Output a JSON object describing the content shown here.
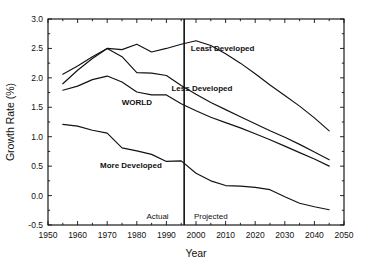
{
  "chart_data": {
    "type": "line",
    "title": "",
    "xlabel": "Year",
    "ylabel": "Growth Rate (%)",
    "xlim": [
      1950,
      2050
    ],
    "ylim": [
      -0.5,
      3.0
    ],
    "xticks": [
      1950,
      1960,
      1970,
      1980,
      1990,
      2000,
      2010,
      2020,
      2030,
      2040,
      2050
    ],
    "xtick_labels": [
      "1950",
      "1960",
      "1970",
      "1980",
      "1990",
      "2000",
      "2010",
      "2020",
      "2030",
      "2040",
      "2050"
    ],
    "yticks": [
      -0.5,
      0.0,
      0.5,
      1.0,
      1.5,
      2.0,
      2.5,
      3.0
    ],
    "ytick_labels": [
      "-0.5",
      "0.0",
      "0.5",
      "1.0",
      "1.5",
      "2.0",
      "2.5",
      "3.0"
    ],
    "grid": false,
    "legend_position": "inline-annotations",
    "x": [
      1955,
      1960,
      1965,
      1970,
      1975,
      1980,
      1985,
      1990,
      1995,
      2000,
      2005,
      2010,
      2015,
      2020,
      2025,
      2030,
      2035,
      2040,
      2045
    ],
    "series": [
      {
        "name": "Least Developed",
        "label": "Least Developed",
        "values": [
          2.06,
          2.2,
          2.36,
          2.5,
          2.48,
          2.57,
          2.44,
          2.5,
          2.57,
          2.63,
          2.55,
          2.41,
          2.25,
          2.07,
          1.88,
          1.7,
          1.52,
          1.32,
          1.1
        ]
      },
      {
        "name": "Less Developed",
        "label": "Less Developed",
        "values": [
          1.9,
          2.13,
          2.33,
          2.5,
          2.36,
          2.09,
          2.08,
          2.04,
          1.87,
          1.72,
          1.58,
          1.46,
          1.34,
          1.22,
          1.1,
          0.99,
          0.87,
          0.74,
          0.61
        ]
      },
      {
        "name": "WORLD",
        "label": "WORLD",
        "values": [
          1.79,
          1.86,
          1.97,
          2.03,
          1.93,
          1.76,
          1.71,
          1.71,
          1.56,
          1.44,
          1.33,
          1.24,
          1.15,
          1.05,
          0.95,
          0.84,
          0.73,
          0.62,
          0.5
        ]
      },
      {
        "name": "More Developed",
        "label": "More Developed",
        "values": [
          1.21,
          1.18,
          1.11,
          1.06,
          0.81,
          0.76,
          0.7,
          0.58,
          0.59,
          0.38,
          0.25,
          0.17,
          0.16,
          0.14,
          0.1,
          -0.02,
          -0.13,
          -0.19,
          -0.24
        ]
      }
    ],
    "annotations": [
      {
        "name": "actual-label",
        "text": "Actual",
        "x": 1987,
        "y": -0.4
      },
      {
        "name": "projected-label",
        "text": "Projected",
        "x": 2005,
        "y": -0.4
      }
    ],
    "divider": {
      "name": "actual-projected-divider",
      "x": 1996,
      "label_left": "Actual",
      "label_right": "Projected"
    },
    "series_label_positions": [
      {
        "series": "Least Developed",
        "x": 2009,
        "y": 2.46
      },
      {
        "series": "Less Developed",
        "x": 2002,
        "y": 1.78
      },
      {
        "series": "WORLD",
        "x": 1980,
        "y": 1.54
      },
      {
        "series": "More Developed",
        "x": 1978,
        "y": 0.47
      }
    ],
    "colors": {
      "line": "#111111",
      "background": "#ffffff",
      "axis": "#111111"
    }
  }
}
